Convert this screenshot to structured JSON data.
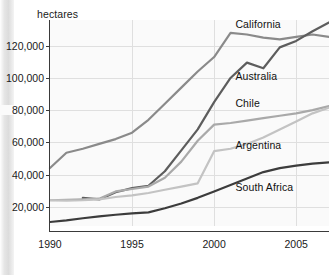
{
  "chart_data": {
    "type": "line",
    "title": "",
    "xlabel": "",
    "ylabel": "hectares",
    "y_unit_label": "hectares",
    "xlim": [
      1990,
      2007
    ],
    "ylim": [
      8000,
      136000
    ],
    "grid": true,
    "legend_position": "inline-right-of-series",
    "x": [
      1990,
      1991,
      1992,
      1993,
      1994,
      1995,
      1996,
      1997,
      1998,
      1999,
      2000,
      2001,
      2002,
      2003,
      2004,
      2005,
      2006,
      2007
    ],
    "xticks": [
      1990,
      1995,
      2000,
      2005
    ],
    "xtick_labels": [
      "1990",
      "1995",
      "2000",
      "2005"
    ],
    "yticks": [
      20000,
      40000,
      60000,
      80000,
      100000,
      120000
    ],
    "ytick_labels": [
      "20,000",
      "40,000",
      "60,000",
      "80,000",
      "100,000",
      "120,000"
    ],
    "series": [
      {
        "name": "California",
        "color": "#8a8a8a",
        "x": [
          1990,
          1991,
          1992,
          1993,
          1994,
          1995,
          1996,
          1997,
          1998,
          1999,
          2000,
          2001,
          2002,
          2003,
          2004,
          2005,
          2006,
          2007
        ],
        "values": [
          44000,
          53500,
          56000,
          59000,
          62000,
          66000,
          74000,
          84000,
          94000,
          104000,
          113000,
          128000,
          127000,
          125000,
          124000,
          125500,
          127000,
          125500
        ]
      },
      {
        "name": "Australia",
        "color": "#5d5d5d",
        "x": [
          1992,
          1993,
          1994,
          1995,
          1996,
          1997,
          1998,
          1999,
          2000,
          2001,
          2002,
          2003,
          2004,
          2005,
          2006,
          2007
        ],
        "values": [
          25500,
          24500,
          29000,
          31500,
          33000,
          42000,
          55000,
          68000,
          85000,
          100000,
          109500,
          106000,
          119000,
          123000,
          129000,
          134500
        ]
      },
      {
        "name": "Chile",
        "color": "#a9a9a9",
        "x": [
          1990,
          1991,
          1992,
          1993,
          1994,
          1995,
          1996,
          1997,
          1998,
          1999,
          2000,
          2001,
          2002,
          2003,
          2004,
          2005,
          2006,
          2007
        ],
        "values": [
          24000,
          24200,
          24500,
          25000,
          29500,
          31000,
          32500,
          38000,
          48000,
          61000,
          71000,
          72000,
          73500,
          75000,
          76500,
          78000,
          80000,
          82500
        ]
      },
      {
        "name": "Argentina",
        "color": "#c3c3c3",
        "x": [
          1990,
          1991,
          1992,
          1993,
          1994,
          1995,
          1996,
          1997,
          1998,
          1999,
          2000,
          2001,
          2002,
          2003,
          2004,
          2005,
          2006,
          2007
        ],
        "values": [
          24000,
          23800,
          24000,
          24500,
          26000,
          27000,
          28500,
          30500,
          32500,
          34500,
          54500,
          56000,
          59000,
          63000,
          68000,
          73000,
          78000,
          81500
        ]
      },
      {
        "name": "South Africa",
        "color": "#3c3c3c",
        "x": [
          1990,
          1991,
          1992,
          1993,
          1994,
          1995,
          1996,
          1997,
          1998,
          1999,
          2000,
          2001,
          2002,
          2003,
          2004,
          2005,
          2006,
          2007
        ],
        "values": [
          10500,
          11500,
          12800,
          14000,
          15000,
          15800,
          16500,
          19000,
          22000,
          25500,
          29500,
          33500,
          37500,
          41500,
          44000,
          45500,
          46800,
          47500
        ]
      }
    ],
    "annotations": [
      {
        "text": "California",
        "x": 2001.3,
        "y": 133000
      },
      {
        "text": "Australia",
        "x": 2001.3,
        "y": 100500
      },
      {
        "text": "Chile",
        "x": 2001.3,
        "y": 83500
      },
      {
        "text": "Argentina",
        "x": 2001.3,
        "y": 57500
      },
      {
        "text": "South Africa",
        "x": 2001.3,
        "y": 31500
      }
    ]
  }
}
